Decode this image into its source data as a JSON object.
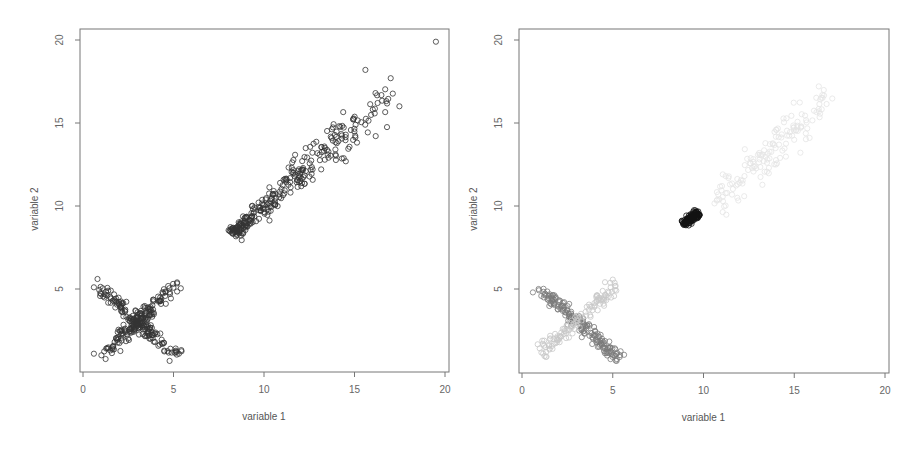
{
  "figure": {
    "panels": [
      {
        "id": "left",
        "title": "",
        "xlabel": "variable 1",
        "ylabel": "variable 2"
      },
      {
        "id": "right",
        "title": "",
        "xlabel": "variable 1",
        "ylabel": "variable 2"
      }
    ]
  },
  "chart_data": [
    {
      "type": "scatter",
      "title": "",
      "xlabel": "variable 1",
      "ylabel": "variable 2",
      "xlim": [
        0,
        20
      ],
      "ylim": [
        0,
        20
      ],
      "xticks": [
        0,
        5,
        10,
        15,
        20
      ],
      "yticks": [
        5,
        10,
        15,
        20
      ],
      "grid": false,
      "legend": null,
      "marker": "open-circle",
      "series": [
        {
          "name": "X-shape arm \\ (descending)",
          "color": "#333333",
          "center": [
            3.0,
            3.0
          ],
          "from": [
            1.0,
            5.0
          ],
          "to": [
            5.2,
            0.9
          ],
          "n": 150,
          "spread": 0.2
        },
        {
          "name": "X-shape arm / (ascending)",
          "color": "#333333",
          "center": [
            3.0,
            3.0
          ],
          "from": [
            1.0,
            1.0
          ],
          "to": [
            5.2,
            5.3
          ],
          "n": 150,
          "spread": 0.2
        },
        {
          "name": "elongated diagonal cluster",
          "color": "#333333",
          "from": [
            8.3,
            8.4
          ],
          "to": [
            17.0,
            16.8
          ],
          "n": 300,
          "spread": 0.45,
          "dense_end": true
        },
        {
          "name": "outliers",
          "color": "#333333",
          "points": [
            [
              19.5,
              19.9
            ],
            [
              15.6,
              18.2
            ],
            [
              17.0,
              17.7
            ],
            [
              0.6,
              5.1
            ],
            [
              0.8,
              5.6
            ],
            [
              0.6,
              1.1
            ],
            [
              5.3,
              1.1
            ],
            [
              5.2,
              5.4
            ]
          ]
        }
      ]
    },
    {
      "type": "scatter",
      "title": "",
      "xlabel": "variable 1",
      "ylabel": "variable 2",
      "xlim": [
        0,
        20
      ],
      "ylim": [
        0,
        20
      ],
      "xticks": [
        0,
        5,
        10,
        15,
        20
      ],
      "yticks": [
        5,
        10,
        15,
        20
      ],
      "grid": false,
      "legend": null,
      "marker": "open-circle (grayscale weighted)",
      "series": [
        {
          "name": "tight cluster (highest weight)",
          "color": "#111111",
          "from": [
            8.9,
            8.9
          ],
          "to": [
            9.7,
            9.6
          ],
          "n": 120,
          "spread": 0.12
        },
        {
          "name": "X-shape arm \\ (medium weight)",
          "color": "#7a7a7a",
          "from": [
            1.0,
            5.0
          ],
          "to": [
            5.3,
            0.9
          ],
          "n": 180,
          "spread": 0.2
        },
        {
          "name": "X-shape arm / (low weight)",
          "color": "#c8c8c8",
          "from": [
            1.0,
            1.0
          ],
          "to": [
            5.3,
            5.4
          ],
          "n": 120,
          "spread": 0.2
        },
        {
          "name": "elongated diagonal cluster (very low weight)",
          "color": "#e4e4e4",
          "from": [
            10.5,
            10.0
          ],
          "to": [
            16.8,
            16.6
          ],
          "n": 150,
          "spread": 0.45
        }
      ]
    }
  ]
}
